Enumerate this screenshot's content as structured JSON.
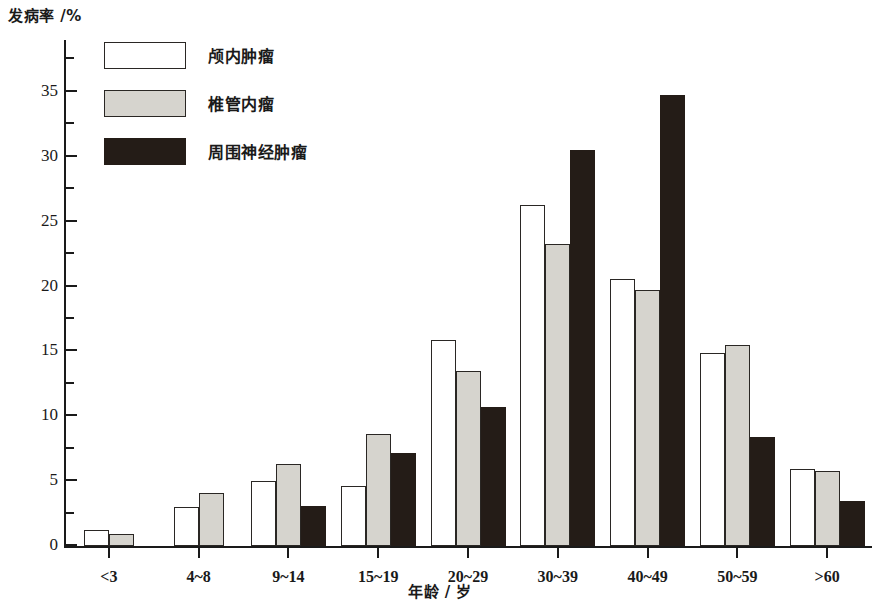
{
  "chart_data": {
    "type": "bar",
    "title": "",
    "xlabel": "年龄 / 岁",
    "ylabel": "发病率 /%",
    "categories": [
      "<3",
      "4~8",
      "9~14",
      "15~19",
      "20~29",
      "30~39",
      "40~49",
      "50~59",
      ">60"
    ],
    "series": [
      {
        "name": "颅内肿瘤",
        "color": "#ffffff",
        "values": [
          1.2,
          3.0,
          5.0,
          4.6,
          15.9,
          26.3,
          20.6,
          14.9,
          5.9
        ]
      },
      {
        "name": "椎管内瘤",
        "color": "#d6d4ce",
        "values": [
          0.9,
          4.1,
          6.3,
          8.6,
          13.5,
          23.3,
          19.7,
          15.5,
          5.8
        ]
      },
      {
        "name": "周围神经肿瘤",
        "color": "#241c17",
        "values": [
          0,
          0,
          3.1,
          7.2,
          10.7,
          30.5,
          34.8,
          8.4,
          3.5
        ]
      }
    ],
    "ylim": [
      0,
      39
    ],
    "y_major_ticks": [
      0,
      5,
      10,
      15,
      20,
      25,
      30,
      35
    ],
    "y_minor_ticks": [
      2.5,
      7.5,
      12.5,
      17.5,
      22.5,
      27.5,
      32.5,
      37.5
    ],
    "y_tick_labels": [
      "0",
      "5",
      "10",
      "15",
      "20",
      "25",
      "30",
      "35"
    ],
    "grid": false,
    "legend_position": "top-left"
  }
}
